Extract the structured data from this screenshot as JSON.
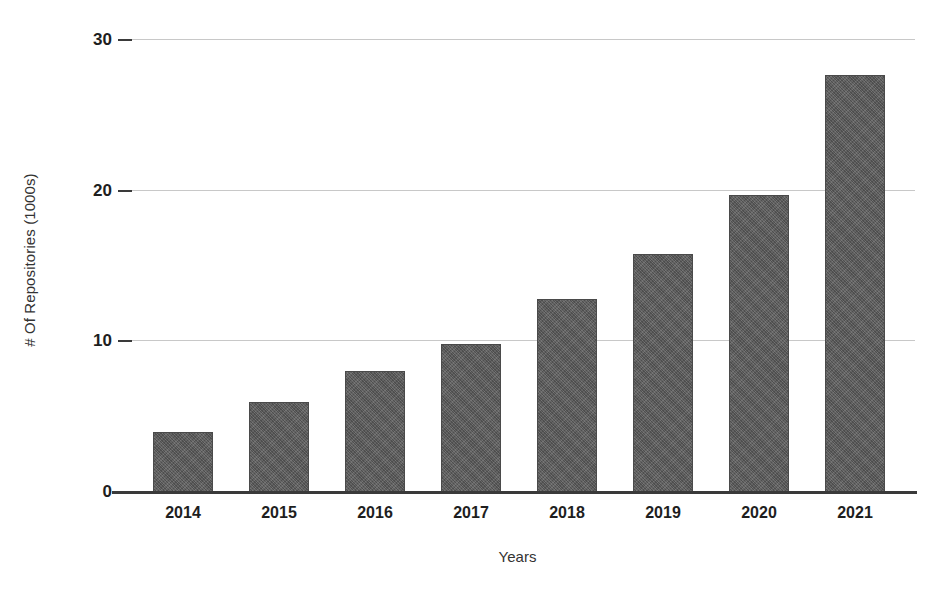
{
  "chart_data": {
    "type": "bar",
    "title": "",
    "xlabel": "Years",
    "ylabel": "# Of Repositories (1000s)",
    "categories": [
      "2014",
      "2015",
      "2016",
      "2017",
      "2018",
      "2019",
      "2020",
      "2021"
    ],
    "values": [
      4.0,
      6.0,
      8.0,
      9.8,
      12.8,
      15.8,
      19.7,
      27.7
    ],
    "ylim": [
      0,
      30
    ],
    "yticks": [
      0,
      10,
      20,
      30
    ],
    "ytick_labels": [
      "0",
      "10",
      "20",
      "30"
    ],
    "grid": "horizontal",
    "legend": "none",
    "series": [
      {
        "name": "# Of Repositories (1000s)",
        "values": [
          4.0,
          6.0,
          8.0,
          9.8,
          12.8,
          15.8,
          19.7,
          27.7
        ],
        "color": "#5a5a5a"
      }
    ]
  },
  "colors": {
    "bar_fill": "#5a5a5a",
    "gridline": "#c8c8c8",
    "axis": "#3a3a3a",
    "text": "#1e1e1e",
    "background": "#ffffff"
  }
}
